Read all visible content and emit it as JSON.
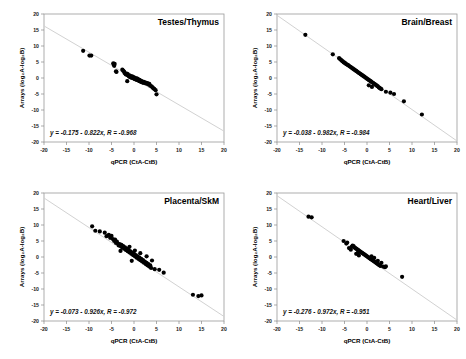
{
  "figure": {
    "panel_count": 4,
    "point_color": "#000000",
    "line_color": "#d2d2d2",
    "frame_color": "#9a9a9a"
  },
  "axes": {
    "xlabel": "qPCR (CtA-CtB)",
    "ylabel": "Arrays (log₂A-log₂B)",
    "xlim": [
      -20,
      20
    ],
    "ylim": [
      -20,
      20
    ],
    "xticks": [
      -20,
      -15,
      -10,
      -5,
      0,
      5,
      10,
      15,
      20
    ],
    "yticks": [
      20,
      15,
      10,
      5,
      0,
      -5,
      -10,
      -15,
      -20
    ],
    "xticklabels": [
      "-20",
      "-15",
      "-10",
      "-5",
      "0",
      "5",
      "10",
      "15",
      "20"
    ],
    "yticklabels": [
      "20",
      "15",
      "10",
      "5",
      "0",
      "-5",
      "-10",
      "-15",
      "-20"
    ],
    "grid": false
  },
  "chart_data": [
    {
      "type": "scatter",
      "title": "Testes/Thymus",
      "xlabel": "qPCR (CtA-CtB)",
      "ylabel": "Arrays (log₂A-log₂B)",
      "xlim": [
        -20,
        20
      ],
      "ylim": [
        -20,
        20
      ],
      "annotation": "y = -0.175 - 0.822x, R = -0.968",
      "fit": {
        "intercept": -0.175,
        "slope": -0.822,
        "r": -0.968
      },
      "points": [
        [
          -11.3,
          8.5
        ],
        [
          -9.9,
          7.0
        ],
        [
          -9.5,
          7.0
        ],
        [
          -4.6,
          4.6
        ],
        [
          -4.5,
          4.2
        ],
        [
          -4.4,
          3.8
        ],
        [
          -4.3,
          4.4
        ],
        [
          -4.0,
          2.1
        ],
        [
          -3.9,
          1.9
        ],
        [
          -2.6,
          2.6
        ],
        [
          -2.4,
          2.3
        ],
        [
          -2.2,
          2.0
        ],
        [
          -2.1,
          1.6
        ],
        [
          -1.9,
          1.3
        ],
        [
          -1.8,
          1.1
        ],
        [
          -1.6,
          1.4
        ],
        [
          -1.5,
          0.9
        ],
        [
          -1.4,
          1.2
        ],
        [
          -1.2,
          0.7
        ],
        [
          -1.1,
          0.5
        ],
        [
          -1.0,
          0.8
        ],
        [
          -0.9,
          0.3
        ],
        [
          -0.8,
          0.6
        ],
        [
          -0.7,
          0.2
        ],
        [
          -0.6,
          0.4
        ],
        [
          -0.5,
          0.1
        ],
        [
          -0.4,
          0.5
        ],
        [
          -0.3,
          0.0
        ],
        [
          -0.2,
          0.3
        ],
        [
          -0.1,
          -0.1
        ],
        [
          0.0,
          0.2
        ],
        [
          0.1,
          -0.3
        ],
        [
          0.2,
          0.0
        ],
        [
          0.3,
          -0.4
        ],
        [
          0.4,
          -0.2
        ],
        [
          0.5,
          -0.5
        ],
        [
          0.6,
          -0.1
        ],
        [
          0.7,
          -0.6
        ],
        [
          0.8,
          -0.3
        ],
        [
          0.9,
          -0.7
        ],
        [
          1.0,
          -0.5
        ],
        [
          1.1,
          -0.9
        ],
        [
          1.2,
          -0.6
        ],
        [
          1.3,
          -1.0
        ],
        [
          1.4,
          -0.8
        ],
        [
          1.5,
          -1.2
        ],
        [
          1.6,
          -0.9
        ],
        [
          1.8,
          -1.3
        ],
        [
          1.9,
          -1.1
        ],
        [
          2.0,
          -1.5
        ],
        [
          2.2,
          -1.2
        ],
        [
          2.4,
          -1.6
        ],
        [
          2.6,
          -1.4
        ],
        [
          2.8,
          -1.8
        ],
        [
          3.0,
          -1.6
        ],
        [
          3.2,
          -2.0
        ],
        [
          3.4,
          -1.8
        ],
        [
          -1.5,
          -1.0
        ],
        [
          3.6,
          -2.4
        ],
        [
          3.9,
          -2.6
        ],
        [
          4.1,
          -2.9
        ],
        [
          4.3,
          -3.2
        ],
        [
          4.5,
          -3.4
        ],
        [
          4.8,
          -3.8
        ],
        [
          5.0,
          -5.1
        ]
      ]
    },
    {
      "type": "scatter",
      "title": "Brain/Breast",
      "xlabel": "qPCR (CtA-CtB)",
      "ylabel": "Arrays (log₂A-log₂B)",
      "xlim": [
        -20,
        20
      ],
      "ylim": [
        -20,
        20
      ],
      "annotation": "y = -0.038 - 0.982x, R = -0.984",
      "fit": {
        "intercept": -0.038,
        "slope": -0.982,
        "r": -0.984
      },
      "points": [
        [
          -13.7,
          13.5
        ],
        [
          -7.6,
          7.4
        ],
        [
          -6.2,
          6.2
        ],
        [
          -6.0,
          5.9
        ],
        [
          -5.8,
          5.7
        ],
        [
          -5.6,
          5.4
        ],
        [
          -5.4,
          5.2
        ],
        [
          -5.2,
          4.9
        ],
        [
          -5.0,
          4.8
        ],
        [
          -4.8,
          4.6
        ],
        [
          -4.6,
          4.3
        ],
        [
          -4.4,
          4.2
        ],
        [
          -4.2,
          4.0
        ],
        [
          -4.0,
          3.8
        ],
        [
          -3.8,
          3.6
        ],
        [
          -3.6,
          3.4
        ],
        [
          -3.4,
          3.2
        ],
        [
          -3.2,
          3.0
        ],
        [
          -3.0,
          2.8
        ],
        [
          -2.8,
          2.6
        ],
        [
          -2.6,
          2.4
        ],
        [
          -2.4,
          2.2
        ],
        [
          -2.2,
          2.0
        ],
        [
          -2.0,
          1.8
        ],
        [
          -1.8,
          1.6
        ],
        [
          -1.6,
          1.4
        ],
        [
          -1.4,
          1.2
        ],
        [
          -1.2,
          1.0
        ],
        [
          -1.0,
          0.8
        ],
        [
          -0.8,
          0.6
        ],
        [
          -0.6,
          0.4
        ],
        [
          -0.4,
          0.2
        ],
        [
          -0.2,
          0.0
        ],
        [
          0.0,
          -0.2
        ],
        [
          0.2,
          -0.4
        ],
        [
          0.4,
          -0.6
        ],
        [
          0.6,
          -0.8
        ],
        [
          0.8,
          -1.0
        ],
        [
          1.0,
          -1.2
        ],
        [
          1.2,
          -1.4
        ],
        [
          1.4,
          -1.6
        ],
        [
          1.6,
          -1.8
        ],
        [
          1.8,
          -2.0
        ],
        [
          2.0,
          -2.2
        ],
        [
          2.2,
          -2.4
        ],
        [
          2.4,
          -2.6
        ],
        [
          2.6,
          -2.9
        ],
        [
          2.8,
          -3.1
        ],
        [
          3.0,
          -3.3
        ],
        [
          3.2,
          -3.5
        ],
        [
          0.4,
          -2.3
        ],
        [
          1.1,
          -2.8
        ],
        [
          4.2,
          -4.3
        ],
        [
          5.2,
          -4.6
        ],
        [
          6.0,
          -5.0
        ],
        [
          8.2,
          -7.3
        ],
        [
          12.2,
          -11.4
        ]
      ]
    },
    {
      "type": "scatter",
      "title": "Placenta/SkM",
      "xlabel": "qPCR (CtA-CtB)",
      "ylabel": "Arrays (log₂A-log₂B)",
      "xlim": [
        -20,
        20
      ],
      "ylim": [
        -20,
        20
      ],
      "annotation": "y = -0.073 - 0.926x, R = -0.972",
      "fit": {
        "intercept": -0.073,
        "slope": -0.926,
        "r": -0.972
      },
      "points": [
        [
          -9.3,
          9.6
        ],
        [
          -8.6,
          8.2
        ],
        [
          -7.6,
          8.0
        ],
        [
          -6.5,
          7.6
        ],
        [
          -6.1,
          6.5
        ],
        [
          -5.6,
          6.9
        ],
        [
          -5.3,
          6.0
        ],
        [
          -5.0,
          6.6
        ],
        [
          -4.7,
          5.6
        ],
        [
          -4.4,
          5.0
        ],
        [
          -4.2,
          5.4
        ],
        [
          -4.0,
          4.4
        ],
        [
          -3.8,
          4.8
        ],
        [
          -3.6,
          4.2
        ],
        [
          -3.4,
          3.6
        ],
        [
          -3.2,
          4.0
        ],
        [
          -3.0,
          3.4
        ],
        [
          -2.8,
          3.8
        ],
        [
          -2.6,
          3.0
        ],
        [
          -2.4,
          3.4
        ],
        [
          -2.2,
          2.6
        ],
        [
          -2.0,
          3.0
        ],
        [
          -1.8,
          2.2
        ],
        [
          -1.6,
          2.6
        ],
        [
          -1.4,
          1.8
        ],
        [
          -1.2,
          2.2
        ],
        [
          -1.0,
          1.4
        ],
        [
          -0.8,
          1.8
        ],
        [
          -0.6,
          1.0
        ],
        [
          -0.4,
          1.4
        ],
        [
          -0.2,
          0.6
        ],
        [
          0.0,
          1.0
        ],
        [
          0.2,
          0.2
        ],
        [
          0.4,
          0.6
        ],
        [
          0.6,
          -0.2
        ],
        [
          0.8,
          0.2
        ],
        [
          1.0,
          -0.6
        ],
        [
          1.2,
          -0.2
        ],
        [
          1.4,
          -1.0
        ],
        [
          1.6,
          -0.6
        ],
        [
          1.8,
          -1.4
        ],
        [
          2.0,
          -1.0
        ],
        [
          2.2,
          -1.8
        ],
        [
          2.4,
          -1.4
        ],
        [
          2.6,
          -2.2
        ],
        [
          2.8,
          -1.8
        ],
        [
          3.0,
          -2.6
        ],
        [
          3.2,
          -2.2
        ],
        [
          3.4,
          -3.0
        ],
        [
          3.6,
          -2.6
        ],
        [
          3.8,
          -3.4
        ],
        [
          -3.0,
          1.9
        ],
        [
          -1.0,
          3.2
        ],
        [
          0.2,
          2.0
        ],
        [
          1.4,
          1.2
        ],
        [
          -0.5,
          -1.2
        ],
        [
          2.8,
          0.2
        ],
        [
          4.0,
          -1.1
        ],
        [
          4.6,
          -3.8
        ],
        [
          5.6,
          -4.0
        ],
        [
          6.6,
          -4.9
        ],
        [
          13.1,
          -11.8
        ],
        [
          14.3,
          -12.2
        ],
        [
          15.0,
          -12.0
        ]
      ]
    },
    {
      "type": "scatter",
      "title": "Heart/Liver",
      "xlabel": "qPCR (CtA-CtB)",
      "ylabel": "Arrays (log₂A-log₂B)",
      "xlim": [
        -20,
        20
      ],
      "ylim": [
        -20,
        20
      ],
      "annotation": "y = -0.276 - 0.972x, R = -0.951",
      "fit": {
        "intercept": -0.276,
        "slope": -0.972,
        "r": -0.951
      },
      "points": [
        [
          -13.0,
          12.6
        ],
        [
          -12.3,
          12.4
        ],
        [
          -5.2,
          5.0
        ],
        [
          -4.6,
          4.2
        ],
        [
          -4.4,
          4.5
        ],
        [
          -4.0,
          2.8
        ],
        [
          -3.6,
          2.3
        ],
        [
          -3.4,
          3.2
        ],
        [
          -3.2,
          3.6
        ],
        [
          -3.0,
          3.4
        ],
        [
          -2.8,
          3.0
        ],
        [
          -2.6,
          2.8
        ],
        [
          -2.4,
          2.6
        ],
        [
          -2.2,
          2.4
        ],
        [
          -2.0,
          2.2
        ],
        [
          -1.8,
          2.0
        ],
        [
          -1.6,
          1.8
        ],
        [
          -1.4,
          1.6
        ],
        [
          -1.2,
          1.4
        ],
        [
          -1.0,
          1.2
        ],
        [
          -0.8,
          1.0
        ],
        [
          -0.6,
          0.8
        ],
        [
          -0.4,
          0.6
        ],
        [
          -0.2,
          0.4
        ],
        [
          0.0,
          0.2
        ],
        [
          0.2,
          0.0
        ],
        [
          0.4,
          -0.2
        ],
        [
          0.6,
          -0.4
        ],
        [
          0.8,
          -0.6
        ],
        [
          1.0,
          -0.8
        ],
        [
          1.2,
          -1.0
        ],
        [
          1.4,
          -1.2
        ],
        [
          1.6,
          -1.4
        ],
        [
          1.8,
          -1.6
        ],
        [
          2.0,
          -1.8
        ],
        [
          2.2,
          -2.0
        ],
        [
          2.4,
          -2.2
        ],
        [
          2.6,
          -2.4
        ],
        [
          2.8,
          -2.6
        ],
        [
          3.0,
          -2.8
        ],
        [
          -2.4,
          1.0
        ],
        [
          -1.8,
          0.5
        ],
        [
          -2.0,
          1.4
        ],
        [
          1.0,
          0.2
        ],
        [
          1.6,
          -0.3
        ],
        [
          2.4,
          -1.2
        ],
        [
          3.2,
          -1.8
        ],
        [
          3.6,
          -3.0
        ],
        [
          4.0,
          -3.2
        ],
        [
          4.2,
          -2.9
        ],
        [
          7.8,
          -6.2
        ]
      ]
    }
  ]
}
